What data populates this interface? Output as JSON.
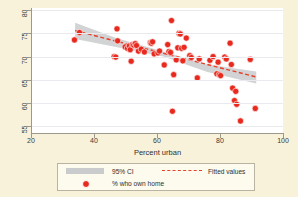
{
  "chart_data": {
    "type": "scatter",
    "title": "",
    "xlabel": "Percent urban",
    "ylabel": "",
    "xlim": [
      20,
      100
    ],
    "ylim": [
      53.5,
      80.5
    ],
    "xticks": [
      20,
      40,
      60,
      80,
      100
    ],
    "yticks": [
      55,
      60,
      65,
      70,
      75,
      80
    ],
    "grid": "horizontal",
    "legend_position": "below-axis",
    "legend": [
      {
        "key": "band",
        "label": "95% CI",
        "color": "#c9cbcd"
      },
      {
        "key": "line",
        "label": "Fitted values",
        "color": "#e8402b"
      },
      {
        "key": "marker",
        "label": "% who own home",
        "color": "#e8291e"
      }
    ],
    "series": [
      {
        "name": "% who own home",
        "marker_color": "#e8291e",
        "points": [
          [
            33.8,
            73.6
          ],
          [
            35.4,
            75.2
          ],
          [
            46.4,
            70.0
          ],
          [
            46.9,
            69.9
          ],
          [
            47.3,
            76.0
          ],
          [
            47.5,
            73.4
          ],
          [
            49.9,
            72.1
          ],
          [
            50.6,
            71.8
          ],
          [
            51.2,
            72.3
          ],
          [
            51.5,
            71.5
          ],
          [
            51.8,
            69.0
          ],
          [
            52.2,
            72.6
          ],
          [
            52.6,
            72.5
          ],
          [
            53.1,
            72.8
          ],
          [
            53.5,
            72.4
          ],
          [
            54.1,
            71.2
          ],
          [
            55.0,
            71.6
          ],
          [
            56.0,
            71.0
          ],
          [
            57.9,
            73.0
          ],
          [
            58.2,
            72.9
          ],
          [
            58.6,
            73.2
          ],
          [
            59.1,
            70.6
          ],
          [
            60.3,
            70.8
          ],
          [
            60.8,
            71.2
          ],
          [
            62.3,
            68.2
          ],
          [
            63.4,
            72.6
          ],
          [
            63.8,
            71.1
          ],
          [
            64.3,
            70.9
          ],
          [
            64.6,
            77.8
          ],
          [
            64.9,
            58.2
          ],
          [
            65.3,
            66.1
          ],
          [
            66.1,
            69.3
          ],
          [
            66.6,
            71.9
          ],
          [
            67.0,
            75.0
          ],
          [
            67.4,
            74.9
          ],
          [
            67.8,
            71.8
          ],
          [
            68.2,
            69.1
          ],
          [
            68.6,
            72.0
          ],
          [
            69.3,
            74.0
          ],
          [
            70.4,
            70.2
          ],
          [
            70.9,
            69.8
          ],
          [
            72.8,
            65.4
          ],
          [
            73.4,
            69.5
          ],
          [
            76.8,
            69.2
          ],
          [
            77.8,
            70.0
          ],
          [
            79.0,
            66.3
          ],
          [
            79.4,
            68.8
          ],
          [
            79.8,
            66.1
          ],
          [
            80.2,
            65.9
          ],
          [
            81.5,
            69.9
          ],
          [
            82.0,
            69.5
          ],
          [
            83.2,
            72.9
          ],
          [
            83.6,
            68.3
          ],
          [
            84.0,
            63.2
          ],
          [
            84.6,
            60.5
          ],
          [
            85.0,
            62.5
          ],
          [
            85.3,
            59.7
          ],
          [
            86.5,
            56.1
          ],
          [
            89.6,
            69.4
          ],
          [
            91.2,
            58.8
          ]
        ]
      }
    ],
    "fit_line": {
      "name": "Fitted values",
      "color": "#e8402b",
      "style": "dashed",
      "x_start": 34.0,
      "y_start": 75.6,
      "x_end": 91.5,
      "y_end": 65.6
    },
    "confidence_band": {
      "name": "95% CI",
      "level": "95%",
      "color": "#c9cbcd",
      "upper": [
        [
          34.0,
          77.3
        ],
        [
          47.0,
          74.0
        ],
        [
          62.0,
          71.1
        ],
        [
          76.0,
          68.3
        ],
        [
          91.5,
          66.8
        ]
      ],
      "lower": [
        [
          34.0,
          73.8
        ],
        [
          47.0,
          72.1
        ],
        [
          62.0,
          70.0
        ],
        [
          76.0,
          66.7
        ],
        [
          91.5,
          64.2
        ]
      ]
    }
  },
  "axes": {
    "x_title": "Percent urban",
    "x_ticklabels": [
      "20",
      "40",
      "60",
      "80",
      "100"
    ],
    "y_ticklabels": [
      "55",
      "60",
      "65",
      "70",
      "75",
      "80"
    ]
  },
  "legend": {
    "ci_label": "95% CI",
    "fitted_label": "Fitted values",
    "marker_label": "% who own home"
  },
  "colors": {
    "background": "#f8f2da",
    "plot_background": "#ffffff",
    "marker": "#e8291e",
    "fit_line": "#e8402b",
    "ci_band": "#c9cbcd",
    "axis": "#9a9a8c",
    "gridline": "#e9e9ee"
  }
}
